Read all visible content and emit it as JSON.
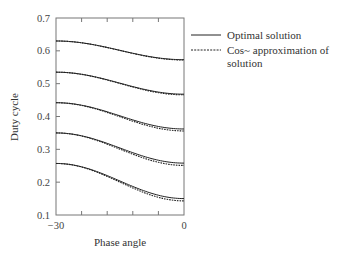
{
  "chart_data": {
    "type": "line",
    "title": "",
    "xlabel": "Phase angle",
    "ylabel": "Duty cycle",
    "xlim": [
      -30,
      0
    ],
    "ylim": [
      0.1,
      0.7
    ],
    "x_tick_labels": [
      "-30",
      "0"
    ],
    "x_ticks": [
      -30,
      -24,
      -18,
      -12,
      -6,
      0
    ],
    "y_ticks": [
      0.1,
      0.2,
      0.3,
      0.4,
      0.5,
      0.6,
      0.7
    ],
    "y_tick_labels": [
      "0.1",
      "0.2",
      "0.3",
      "0.4",
      "0.5",
      "0.6",
      "0.7"
    ],
    "grid": false,
    "legend_position": "right-outside-top",
    "x": [
      -30,
      -24,
      -18,
      -12,
      -6,
      0
    ],
    "series": [
      {
        "name": "Optimal solution",
        "style": "solid",
        "curve": 1,
        "values": [
          0.63,
          0.624,
          0.61,
          0.593,
          0.579,
          0.573
        ]
      },
      {
        "name": "Cos~ approximation of solution",
        "style": "dashed",
        "curve": 1,
        "values": [
          0.63,
          0.623,
          0.609,
          0.592,
          0.578,
          0.572
        ]
      },
      {
        "name": "Optimal solution",
        "style": "solid",
        "curve": 2,
        "values": [
          0.535,
          0.528,
          0.511,
          0.49,
          0.474,
          0.468
        ]
      },
      {
        "name": "Cos~ approximation of solution",
        "style": "dashed",
        "curve": 2,
        "values": [
          0.535,
          0.527,
          0.51,
          0.489,
          0.472,
          0.466
        ]
      },
      {
        "name": "Optimal solution",
        "style": "solid",
        "curve": 3,
        "values": [
          0.442,
          0.434,
          0.413,
          0.388,
          0.368,
          0.362
        ]
      },
      {
        "name": "Cos~ approximation of solution",
        "style": "dashed",
        "curve": 3,
        "values": [
          0.442,
          0.433,
          0.411,
          0.385,
          0.364,
          0.356
        ]
      },
      {
        "name": "Optimal solution",
        "style": "solid",
        "curve": 4,
        "values": [
          0.35,
          0.341,
          0.316,
          0.287,
          0.264,
          0.258
        ]
      },
      {
        "name": "Cos~ approximation of solution",
        "style": "dashed",
        "curve": 4,
        "values": [
          0.35,
          0.34,
          0.314,
          0.283,
          0.259,
          0.251
        ]
      },
      {
        "name": "Optimal solution",
        "style": "solid",
        "curve": 5,
        "values": [
          0.257,
          0.247,
          0.219,
          0.185,
          0.158,
          0.15
        ]
      },
      {
        "name": "Cos~ approximation of solution",
        "style": "dashed",
        "curve": 5,
        "values": [
          0.257,
          0.246,
          0.216,
          0.181,
          0.152,
          0.143
        ]
      }
    ],
    "legend": [
      {
        "label": "Optimal solution",
        "style": "solid"
      },
      {
        "label": "Cos~ approximation of solution",
        "style": "dashed",
        "lines": [
          "Cos~ approximation of",
          "solution"
        ]
      }
    ]
  },
  "colors": {
    "axis": "#777777",
    "line": "#222222",
    "text": "#333333"
  }
}
